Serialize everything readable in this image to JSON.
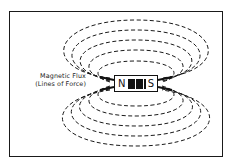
{
  "diagram": {
    "label_line1": "Magnetic Flux",
    "label_line2": "(Lines of Force)",
    "magnet": {
      "north": "N",
      "south": "S"
    },
    "field_lines": {
      "top_count": 5,
      "bottom_count": 5,
      "style": "dashed"
    },
    "colors": {
      "line": "#1a1a1a",
      "background": "#ffffff"
    }
  }
}
